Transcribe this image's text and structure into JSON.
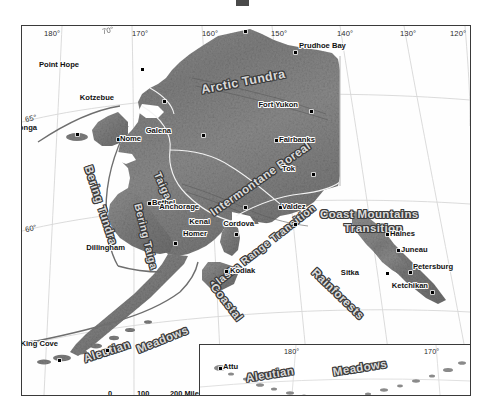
{
  "figure": {
    "title_remnant": ""
  },
  "main_map": {
    "longitude_ticks": [
      {
        "label": "180°",
        "x": 34
      },
      {
        "label": "170°",
        "x": 102
      },
      {
        "label": "170°",
        "x": 128
      },
      {
        "label": "160°",
        "x": 198
      },
      {
        "label": "150°",
        "x": 268
      },
      {
        "label": "140°",
        "x": 333
      },
      {
        "label": "130°",
        "x": 395
      },
      {
        "label": "120°",
        "x": 455
      }
    ],
    "longitude_top_partial": "70°",
    "latitude_ticks": [
      {
        "label": "65°",
        "y": 98
      },
      {
        "label": "60°",
        "y": 207
      },
      {
        "label": "55°",
        "y": 322
      }
    ],
    "ecoregions": [
      {
        "name": "Arctic Tundra",
        "x": 178,
        "y": 57,
        "rot": -11,
        "size": 12.5
      },
      {
        "name": "Bering Tundra",
        "x": 72,
        "y": 138,
        "rot": 72,
        "size": 11.5
      },
      {
        "name": "Bering Taiga",
        "x": 122,
        "y": 176,
        "rot": 76,
        "size": 10.5
      },
      {
        "name": "Taiga",
        "x": 141,
        "y": 144,
        "rot": 66,
        "size": 10.5
      },
      {
        "name": "Intermontane Boreal",
        "x": 186,
        "y": 182,
        "rot": -35,
        "size": 11.5
      },
      {
        "name": "Alaska Range Transition",
        "x": 185,
        "y": 256,
        "rot": -38,
        "size": 10.5
      },
      {
        "name": "Coast Mountains",
        "x": 298,
        "y": 182,
        "rot": 0,
        "size": 11.5
      },
      {
        "name": "Transition",
        "x": 322,
        "y": 196,
        "rot": 0,
        "size": 11.5
      },
      {
        "name": "Coastal",
        "x": 196,
        "y": 255,
        "rot": 52,
        "size": 11.5
      },
      {
        "name": "Rainforests",
        "x": 296,
        "y": 240,
        "rot": 44,
        "size": 11.5
      },
      {
        "name": "Aleutian",
        "x": 60,
        "y": 327,
        "rot": -18,
        "size": 11.5
      },
      {
        "name": "Meadows",
        "x": 113,
        "y": 318,
        "rot": -22,
        "size": 11.5
      }
    ],
    "cities": [
      {
        "name": "Barrow",
        "dx": 222,
        "dy": 4,
        "lx": -4,
        "ly": -11,
        "anchor": "left"
      },
      {
        "name": "Prudhoe Bay",
        "dx": 272,
        "dy": 25,
        "lx": 5,
        "ly": -10,
        "anchor": "left"
      },
      {
        "name": "Point Hope",
        "dx": 119,
        "dy": 42,
        "lx": -62,
        "ly": -8,
        "anchor": "left"
      },
      {
        "name": "Kotzebue",
        "dx": 141,
        "dy": 74,
        "lx": -49,
        "ly": -7,
        "anchor": "left"
      },
      {
        "name": "Fort Yukon",
        "dx": 288,
        "dy": 84,
        "lx": -12,
        "ly": -10,
        "anchor": "left"
      },
      {
        "name": "Savoonga",
        "dx": 54,
        "dy": 107,
        "lx": -39,
        "ly": -10,
        "anchor": "left"
      },
      {
        "name": "Nome",
        "dx": 95,
        "dy": 112,
        "lx": 3,
        "ly": -4,
        "anchor": "left"
      },
      {
        "name": "Galena",
        "dx": 180,
        "dy": 108,
        "lx": -31,
        "ly": -8,
        "anchor": "left"
      },
      {
        "name": "Fairbanks",
        "dx": 253,
        "dy": 113,
        "lx": 4,
        "ly": -4,
        "anchor": "left"
      },
      {
        "name": "Tok",
        "dx": 290,
        "dy": 147,
        "lx": -17,
        "ly": -9,
        "anchor": "left"
      },
      {
        "name": "Bethel",
        "dx": 126,
        "dy": 176,
        "lx": 4,
        "ly": -4,
        "anchor": "left"
      },
      {
        "name": "Anchorage",
        "dx": 222,
        "dy": 180,
        "lx": -45,
        "ly": -4,
        "anchor": "left"
      },
      {
        "name": "Valdez",
        "dx": 257,
        "dy": 180,
        "lx": 3,
        "ly": -4,
        "anchor": "left"
      },
      {
        "name": "Kenai",
        "dx": 214,
        "dy": 195,
        "lx": -26,
        "ly": -4,
        "anchor": "left"
      },
      {
        "name": "Cordova",
        "dx": 272,
        "dy": 197,
        "lx": -40,
        "ly": -4,
        "anchor": "left"
      },
      {
        "name": "Homer",
        "dx": 213,
        "dy": 207,
        "lx": -28,
        "ly": -4,
        "anchor": "left"
      },
      {
        "name": "Dillingham",
        "dx": 152,
        "dy": 216,
        "lx": -49,
        "ly": 1,
        "anchor": "left"
      },
      {
        "name": "Haines",
        "dx": 364,
        "dy": 207,
        "lx": 4,
        "ly": -4,
        "anchor": "left"
      },
      {
        "name": "Juneau",
        "dx": 375,
        "dy": 223,
        "lx": 4,
        "ly": -4,
        "anchor": "left"
      },
      {
        "name": "Kodiak",
        "dx": 203,
        "dy": 244,
        "lx": 5,
        "ly": -4,
        "anchor": "left"
      },
      {
        "name": "Petersburg",
        "dx": 387,
        "dy": 245,
        "lx": 4,
        "ly": -9,
        "anchor": "left"
      },
      {
        "name": "Sitka",
        "dx": 364,
        "dy": 246,
        "lx": -27,
        "ly": -4,
        "anchor": "left"
      },
      {
        "name": "Ketchikan",
        "dx": 409,
        "dy": 265,
        "lx": -3,
        "ly": -10,
        "anchor": "left"
      },
      {
        "name": "King Cove",
        "dx": 84,
        "dy": 323,
        "lx": -48,
        "ly": -10,
        "anchor": "left"
      },
      {
        "name": "Unalaska",
        "dx": 36,
        "dy": 333,
        "lx": -50,
        "ly": -5,
        "anchor": "left"
      }
    ],
    "scale_bar": {
      "labels": [
        {
          "text": "0",
          "x": 0
        },
        {
          "text": "100",
          "x": 31
        },
        {
          "text": "200 Miles",
          "x": 63
        }
      ],
      "segments": [
        "#000000",
        "#ffffff",
        "#000000"
      ]
    }
  },
  "inset_map": {
    "longitude_ticks": [
      {
        "label": "180°",
        "x": 95
      },
      {
        "label": "170°",
        "x": 233
      }
    ],
    "ecoregions": [
      {
        "name": "Aleutian",
        "x": 45,
        "y": 27,
        "rot": -9,
        "size": 11.5
      },
      {
        "name": "Meadows",
        "x": 132,
        "y": 21,
        "rot": -9,
        "size": 11.5
      }
    ],
    "cities": [
      {
        "name": "Attu",
        "dx": 19,
        "dy": 22,
        "lx": 4,
        "ly": -5
      },
      {
        "name": "Adak",
        "dx": 139,
        "dy": 54,
        "lx": -3,
        "ly": 2
      }
    ]
  },
  "colors": {
    "frame": "#3a3a3a",
    "graticule": "#d2d2d2",
    "land_light": "#9a9a9a",
    "land_mid": "#7f7f7f",
    "land_dark": "#5e5e5e",
    "boundary": "#f2f2f2",
    "ecoregion_fill": "#d9d9d9",
    "ecoregion_outline": "#3b3b3b",
    "background": "#ffffff",
    "text": "#111111"
  }
}
